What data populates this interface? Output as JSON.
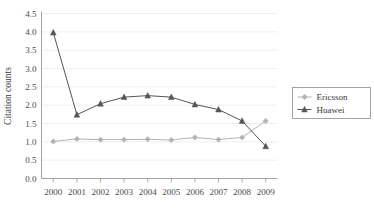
{
  "chart_data": {
    "type": "line",
    "title": "",
    "xlabel": "",
    "ylabel": "Citation counts",
    "categories": [
      "2000",
      "2001",
      "2002",
      "2003",
      "2004",
      "2005",
      "2006",
      "2007",
      "2008",
      "2009"
    ],
    "x": [
      2000,
      2001,
      2002,
      2003,
      2004,
      2005,
      2006,
      2007,
      2008,
      2009
    ],
    "ylim": [
      0.0,
      4.5
    ],
    "yticks": [
      "0.0",
      "0.5",
      "1.0",
      "1.5",
      "2.0",
      "2.5",
      "3.0",
      "3.5",
      "4.0",
      "4.5"
    ],
    "ytick_values": [
      0.0,
      0.5,
      1.0,
      1.5,
      2.0,
      2.5,
      3.0,
      3.5,
      4.0,
      4.5
    ],
    "grid": true,
    "grid_axis": "y",
    "legend_position": "right",
    "series": [
      {
        "name": "Ericsson",
        "marker": "diamond",
        "color": "#b3b3b3",
        "values": [
          1.01,
          1.08,
          1.06,
          1.06,
          1.07,
          1.05,
          1.12,
          1.06,
          1.12,
          1.57
        ]
      },
      {
        "name": "Huawei",
        "marker": "triangle",
        "color": "#555555",
        "values": [
          3.98,
          1.74,
          2.04,
          2.22,
          2.26,
          2.22,
          2.02,
          1.88,
          1.57,
          0.88
        ]
      }
    ]
  },
  "legend": {
    "entries": [
      {
        "label": "Ericsson"
      },
      {
        "label": "Huawei"
      }
    ]
  },
  "axes": {
    "y_title": "Citation counts"
  }
}
